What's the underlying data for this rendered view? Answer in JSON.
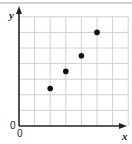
{
  "chart_data": {
    "type": "scatter",
    "title": "",
    "xlabel": "x",
    "ylabel": "y",
    "origin_labels": [
      "0",
      "0"
    ],
    "xlim": [
      0,
      7
    ],
    "ylim": [
      0,
      7
    ],
    "grid": true,
    "legend": null,
    "points": [
      {
        "x": 2,
        "y": 2.4
      },
      {
        "x": 3,
        "y": 3.5
      },
      {
        "x": 4,
        "y": 4.5
      },
      {
        "x": 5,
        "y": 6
      }
    ]
  },
  "colors": {
    "grid": "#d0d0d0",
    "axis": "#222222",
    "point": "#111111",
    "top_rule": "#d4d4d4"
  }
}
